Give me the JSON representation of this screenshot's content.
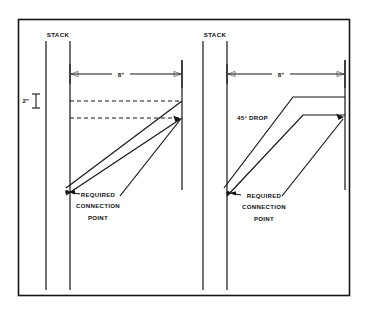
{
  "diagram": {
    "frame": {
      "border_color": "#151515"
    },
    "views": [
      {
        "id": "left-view",
        "stack_label": "STACK",
        "run_dimension": "8\"",
        "offset_dimension": "2\"",
        "callout": {
          "line1": "REQUIRED",
          "line2": "CONNECTION",
          "line3": "POINT"
        }
      },
      {
        "id": "right-view",
        "stack_label": "STACK",
        "run_dimension": "8\"",
        "drop_label": "45° DROP",
        "callout": {
          "line1": "REQUIRED",
          "line2": "CONNECTION",
          "line3": "POINT"
        }
      }
    ]
  },
  "colors": {
    "ink": "#151515",
    "paper": "#ffffff"
  }
}
